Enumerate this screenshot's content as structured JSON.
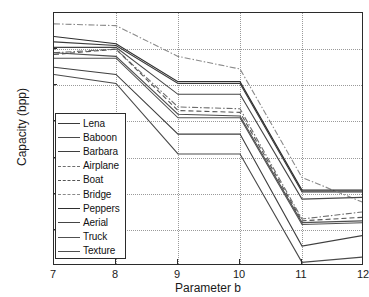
{
  "chart_data": {
    "type": "line",
    "title": "",
    "xlabel": "Parameter b",
    "ylabel": "Capacity (bpp)",
    "x": [
      7,
      8,
      9,
      10,
      11,
      12
    ],
    "xlim": [
      7,
      12
    ],
    "ylim": [
      1.2,
      2.6
    ],
    "xticks": [
      "7",
      "8",
      "9",
      "10",
      "11",
      "12"
    ],
    "yticks": [
      "1.2",
      "1.4",
      "1.6",
      "1.8",
      "2",
      "2.2",
      "2.4",
      "2.6"
    ],
    "grid": true,
    "legend_position": "lower left",
    "series": [
      {
        "name": "Lena",
        "style": "solid",
        "color": "#3a3a3a",
        "values": [
          2.44,
          2.42,
          2.21,
          2.21,
          1.61,
          1.61
        ]
      },
      {
        "name": "Baboon",
        "style": "solid",
        "color": "#4a4a4a",
        "values": [
          2.26,
          2.21,
          1.82,
          1.82,
          1.22,
          1.25
        ]
      },
      {
        "name": "Barbara",
        "style": "solid",
        "color": "#3f3f3f",
        "values": [
          2.3,
          2.26,
          1.93,
          1.93,
          1.31,
          1.37
        ]
      },
      {
        "name": "Airplane",
        "style": "dashdot",
        "color": "#6e6e6e",
        "values": [
          2.38,
          2.4,
          2.08,
          2.07,
          1.46,
          1.5
        ]
      },
      {
        "name": "Boat",
        "style": "dashed",
        "color": "#555555",
        "values": [
          2.37,
          2.4,
          2.06,
          2.05,
          1.45,
          1.47
        ]
      },
      {
        "name": "Bridge",
        "style": "dashdot",
        "color": "#8a8a8a",
        "values": [
          2.54,
          2.53,
          2.36,
          2.29,
          1.69,
          1.55
        ]
      },
      {
        "name": "Peppers",
        "style": "solid",
        "color": "#2e2e2e",
        "values": [
          2.47,
          2.43,
          2.22,
          2.22,
          1.62,
          1.62
        ]
      },
      {
        "name": "Aerial",
        "style": "solid",
        "color": "#454545",
        "values": [
          2.41,
          2.41,
          2.15,
          2.15,
          1.57,
          1.58
        ]
      },
      {
        "name": "Truck",
        "style": "solid",
        "color": "#505050",
        "values": [
          2.35,
          2.35,
          2.02,
          2.02,
          1.43,
          1.44
        ]
      },
      {
        "name": "Texture",
        "style": "solid",
        "color": "#4f4f4f",
        "values": [
          2.38,
          2.36,
          2.04,
          2.03,
          1.44,
          1.45
        ]
      }
    ]
  }
}
